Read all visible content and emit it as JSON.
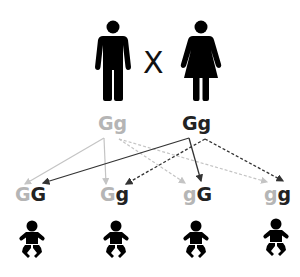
{
  "colors": {
    "dominant_parent": "#222222",
    "recessive_parent": "#b5b5b5",
    "icon": "#000000"
  },
  "parents": {
    "father": {
      "icon": "male-person-icon",
      "genotype": [
        "G",
        "g"
      ],
      "tone": "light"
    },
    "cross_symbol": "X",
    "mother": {
      "icon": "female-person-icon",
      "genotype": [
        "G",
        "g"
      ],
      "tone": "dark"
    }
  },
  "offspring": [
    {
      "alleles": [
        {
          "letter": "G",
          "tone": "light"
        },
        {
          "letter": "G",
          "tone": "dark"
        }
      ],
      "icon": "baby-icon"
    },
    {
      "alleles": [
        {
          "letter": "G",
          "tone": "light"
        },
        {
          "letter": "g",
          "tone": "dark"
        }
      ],
      "icon": "baby-icon"
    },
    {
      "alleles": [
        {
          "letter": "g",
          "tone": "light"
        },
        {
          "letter": "G",
          "tone": "dark"
        }
      ],
      "icon": "baby-icon"
    },
    {
      "alleles": [
        {
          "letter": "g",
          "tone": "light"
        },
        {
          "letter": "g",
          "tone": "dark"
        }
      ],
      "icon": "baby-icon"
    }
  ],
  "arrows": [
    {
      "from": "father.G",
      "to": "offspring.0.left",
      "style": "solid",
      "tone": "light"
    },
    {
      "from": "father.G",
      "to": "offspring.1.left",
      "style": "solid",
      "tone": "light"
    },
    {
      "from": "father.g",
      "to": "offspring.2.left",
      "style": "dashed",
      "tone": "light"
    },
    {
      "from": "father.g",
      "to": "offspring.3.left",
      "style": "dashed",
      "tone": "light"
    },
    {
      "from": "mother.G",
      "to": "offspring.0.right",
      "style": "solid",
      "tone": "dark"
    },
    {
      "from": "mother.G",
      "to": "offspring.2.right",
      "style": "solid",
      "tone": "dark"
    },
    {
      "from": "mother.g",
      "to": "offspring.1.right",
      "style": "dashed",
      "tone": "dark"
    },
    {
      "from": "mother.g",
      "to": "offspring.3.right",
      "style": "dashed",
      "tone": "dark"
    }
  ]
}
